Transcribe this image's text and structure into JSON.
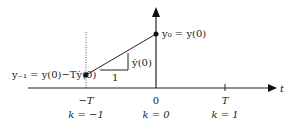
{
  "diagram": {
    "axis_label_t": "t",
    "point_current_label": "y₀ = y(0)",
    "point_prev_label": "y₋₁ = y(0)−Tẏ(0)",
    "slope_rise_label": "ẏ(0)",
    "slope_run_label": "1",
    "ticks": [
      {
        "time": "−T",
        "index": "k = −1"
      },
      {
        "time": "0",
        "index": "k = 0"
      },
      {
        "time": "T",
        "index": "k = 1"
      }
    ],
    "colors": {
      "line": "#222222"
    }
  }
}
